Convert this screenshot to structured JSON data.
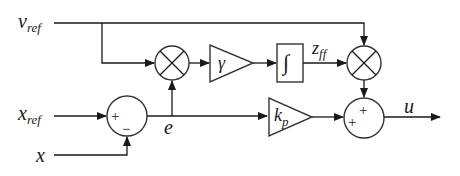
{
  "diagram": {
    "type": "block-diagram",
    "signals": {
      "v_ref": {
        "main": "v",
        "sub": "ref"
      },
      "x_ref": {
        "main": "x",
        "sub": "ref"
      },
      "x": {
        "main": "x"
      },
      "e": {
        "main": "e"
      },
      "z_ff": {
        "main": "z",
        "sub": "ff"
      },
      "u": {
        "main": "u"
      }
    },
    "blocks": {
      "gain_gamma": {
        "label": "γ"
      },
      "integrator": {
        "label": "∫"
      },
      "gain_kp": {
        "main": "k",
        "sub": "p"
      }
    },
    "junctions": {
      "sum_error": {
        "signs": [
          "+",
          "−"
        ]
      },
      "mult_1": {
        "symbol": "×"
      },
      "mult_2": {
        "symbol": "×"
      },
      "sum_output": {
        "signs": [
          "+",
          "+"
        ]
      }
    },
    "colors": {
      "line": "#1a1a1a",
      "shape_stroke": "#333333",
      "background": "#ffffff"
    }
  }
}
